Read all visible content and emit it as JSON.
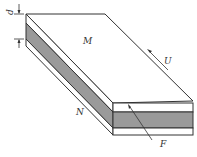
{
  "diagram": {
    "type": "3d-slab-layers",
    "labels": {
      "top_plate": "M",
      "bottom_plate": "N",
      "thickness": "d",
      "velocity": "U",
      "force": "F"
    },
    "colors": {
      "stroke": "#333333",
      "fill_white": "#ffffff",
      "fill_middle_layer": "#9a9a9a"
    }
  }
}
